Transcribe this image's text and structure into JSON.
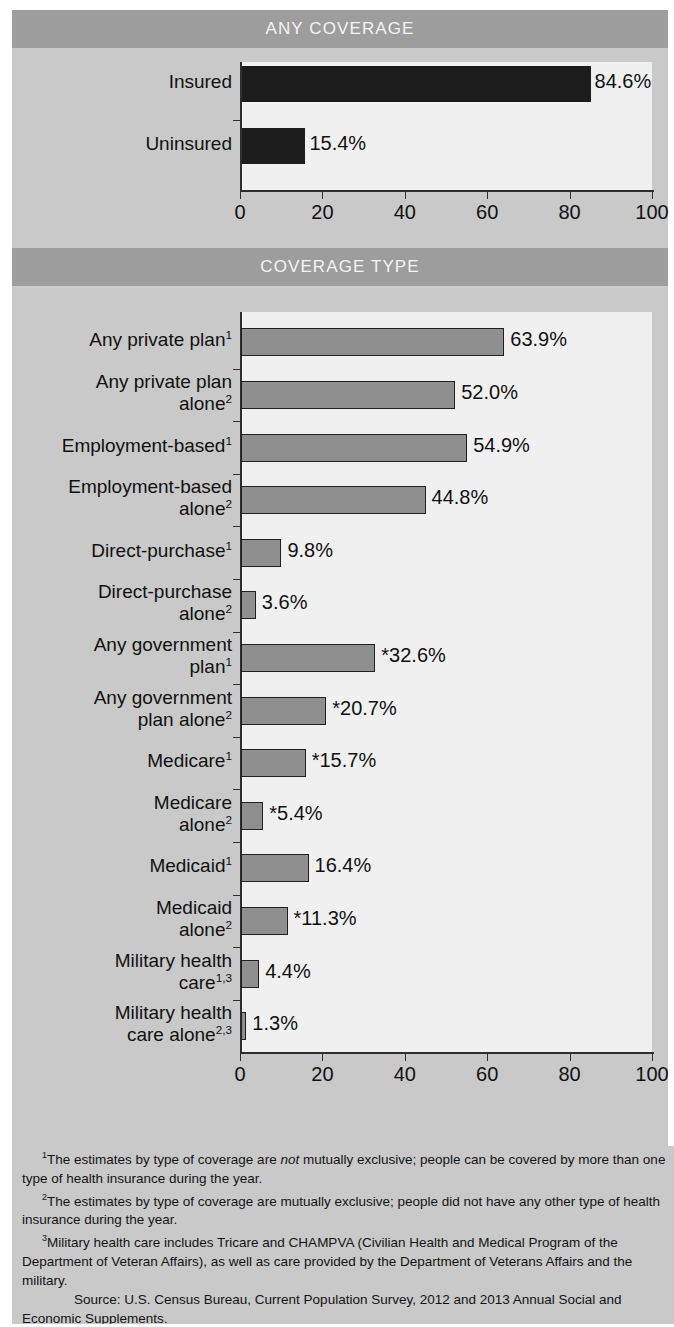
{
  "sections": {
    "any_coverage_title": "ANY COVERAGE",
    "coverage_type_title": "COVERAGE TYPE"
  },
  "colors": {
    "band": "#9d9d9d",
    "sheet": "#c9c9c9",
    "plot": "#f0f0f0",
    "bar_dark": "#1d1d1d",
    "bar_grey": "#8f8f8f",
    "axis": "#2e2e2e",
    "text": "#111111",
    "band_text": "#f4f4f4"
  },
  "axis": {
    "ticks": [
      "0",
      "20",
      "40",
      "60",
      "80",
      "100"
    ],
    "min": 0,
    "max": 100
  },
  "footnotes": [
    {
      "marker": "1",
      "text_a": "The estimates by type of coverage are ",
      "emph": "not",
      "text_b": " mutually exclusive; people can be covered by more than one type of health insurance during the year."
    },
    {
      "marker": "2",
      "text_a": "The estimates by type of coverage are mutually exclusive; people did not have any other type of health insurance during the year.",
      "emph": "",
      "text_b": ""
    },
    {
      "marker": "3",
      "text_a": "Military health care includes Tricare and CHAMPVA (Civilian Health and Medical Program of the Department of Veteran Affairs), as well as care provided by the Department of Veterans Affairs and the military.",
      "emph": "",
      "text_b": ""
    }
  ],
  "source": "Source: U.S. Census Bureau, Current Population Survey, 2012 and 2013 Annual Social and Economic Supplements.",
  "chart_data": [
    {
      "type": "bar",
      "orientation": "horizontal",
      "title": "ANY COVERAGE",
      "xlabel": "",
      "ylabel": "",
      "xlim": [
        0,
        100
      ],
      "grid": false,
      "legend": "none",
      "tick_labels": [
        "0",
        "20",
        "40",
        "60",
        "80",
        "100"
      ],
      "categories": [
        "Insured",
        "Uninsured"
      ],
      "values": [
        84.6,
        15.4
      ],
      "data_labels": [
        "84.6%",
        "15.4%"
      ],
      "bar_color": "#1d1d1d"
    },
    {
      "type": "bar",
      "orientation": "horizontal",
      "title": "COVERAGE TYPE",
      "xlabel": "",
      "ylabel": "",
      "xlim": [
        0,
        100
      ],
      "grid": false,
      "legend": "none",
      "tick_labels": [
        "0",
        "20",
        "40",
        "60",
        "80",
        "100"
      ],
      "categories": [
        "Any private plan¹",
        "Any private plan alone²",
        "Employment-based¹",
        "Employment-based alone²",
        "Direct-purchase¹",
        "Direct-purchase alone²",
        "Any government plan¹",
        "Any government plan alone²",
        "Medicare¹",
        "Medicare alone²",
        "Medicaid¹",
        "Medicaid alone²",
        "Military health care¹˒³",
        "Military health care alone²˒³"
      ],
      "values": [
        63.9,
        52.0,
        54.9,
        44.8,
        9.8,
        3.6,
        32.6,
        20.7,
        15.7,
        5.4,
        16.4,
        11.3,
        4.4,
        1.3
      ],
      "data_labels": [
        "63.9%",
        "52.0%",
        "54.9%",
        "44.8%",
        "9.8%",
        "3.6%",
        "*32.6%",
        "*20.7%",
        "*15.7%",
        "*5.4%",
        "16.4%",
        "*11.3%",
        "4.4%",
        "1.3%"
      ],
      "bar_color": "#8f8f8f"
    }
  ],
  "top_rows": [
    {
      "line1": "Insured",
      "sup": "",
      "value": 84.6,
      "label": "84.6%"
    },
    {
      "line1": "Uninsured",
      "sup": "",
      "value": 15.4,
      "label": "15.4%"
    }
  ],
  "type_rows": [
    {
      "line1": "Any private plan",
      "line2": "",
      "sup1": "1",
      "sup2": "",
      "value": 63.9,
      "label": "63.9%"
    },
    {
      "line1": "Any private plan",
      "line2": "alone",
      "sup1": "",
      "sup2": "2",
      "value": 52.0,
      "label": "52.0%"
    },
    {
      "line1": "Employment-based",
      "line2": "",
      "sup1": "1",
      "sup2": "",
      "value": 54.9,
      "label": "54.9%"
    },
    {
      "line1": "Employment-based",
      "line2": "alone",
      "sup1": "",
      "sup2": "2",
      "value": 44.8,
      "label": "44.8%"
    },
    {
      "line1": "Direct-purchase",
      "line2": "",
      "sup1": "1",
      "sup2": "",
      "value": 9.8,
      "label": "9.8%"
    },
    {
      "line1": "Direct-purchase",
      "line2": "alone",
      "sup1": "",
      "sup2": "2",
      "value": 3.6,
      "label": "3.6%"
    },
    {
      "line1": "Any government",
      "line2": "plan",
      "sup1": "",
      "sup2": "1",
      "value": 32.6,
      "label": "*32.6%"
    },
    {
      "line1": "Any government",
      "line2": "plan alone",
      "sup1": "",
      "sup2": "2",
      "value": 20.7,
      "label": "*20.7%"
    },
    {
      "line1": "Medicare",
      "line2": "",
      "sup1": "1",
      "sup2": "",
      "value": 15.7,
      "label": "*15.7%"
    },
    {
      "line1": "Medicare",
      "line2": "alone",
      "sup1": "",
      "sup2": "2",
      "value": 5.4,
      "label": "*5.4%"
    },
    {
      "line1": "Medicaid",
      "line2": "",
      "sup1": "1",
      "sup2": "",
      "value": 16.4,
      "label": "16.4%"
    },
    {
      "line1": "Medicaid",
      "line2": "alone",
      "sup1": "",
      "sup2": "2",
      "value": 11.3,
      "label": "*11.3%"
    },
    {
      "line1": "Military health",
      "line2": "care",
      "sup1": "",
      "sup2": "1,3",
      "value": 4.4,
      "label": "4.4%"
    },
    {
      "line1": "Military health",
      "line2": "care alone",
      "sup1": "",
      "sup2": "2,3",
      "value": 1.3,
      "label": "1.3%"
    }
  ]
}
